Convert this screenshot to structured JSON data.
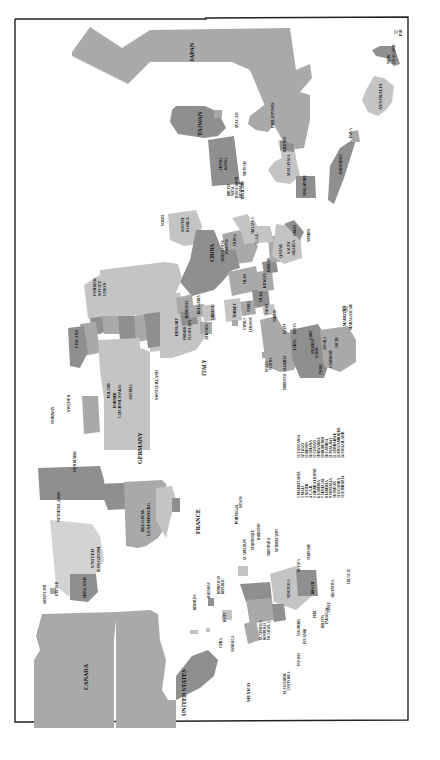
{
  "map": {
    "title": "Cartogram of countries (rotated world map)",
    "orientation": "rotated 90 degrees; labels read bottom-to-top",
    "colors": {
      "background": "#ffffff",
      "border": "#222222",
      "dark": "#8f8f8f",
      "medium": "#a9a9a9",
      "light": "#c4c4c4",
      "lighter": "#d3d3d3",
      "label": "#111111"
    },
    "regions": {
      "asia_pacific": [
        "JAPAN",
        "TAIWAN",
        "MACAO",
        "HONG KONG",
        "PHILIPPINES",
        "BRUNEI",
        "MALAYSIA",
        "SINGAPORE",
        "INDONESIA",
        "PAPUA NEW GUINEA",
        "AUSTRALIA",
        "NEW ZEALAND",
        "FIJI",
        "VIETNAM",
        "THAILAND",
        "MYANMAR",
        "BANGLADESH",
        "NEPAL",
        "BHUTAN",
        "SOUTH KOREA",
        "NORTH KOREA",
        "CHINA",
        "INDIA",
        "SRI LANKA",
        "PAKISTAN",
        "AFGHANISTAN"
      ],
      "middle_east": [
        "IRAN",
        "IRAQ",
        "SYRIA",
        "TURKEY",
        "ISRAEL",
        "JORDAN",
        "LEBANON",
        "CYPRUS",
        "KUWAIT",
        "BAHRAIN",
        "QATAR",
        "U.A.E.",
        "SAUDI ARABIA",
        "OMAN",
        "YEMEN"
      ],
      "europe": [
        "FORMER SOVIET UNION",
        "FINLAND",
        "SWEDEN",
        "NORWAY",
        "POLAND",
        "FORMER CZECHOSLOVAKIA",
        "AUSTRIA",
        "SWITZERLAND",
        "HUNGARY",
        "ROMANIA",
        "BULGARIA",
        "FORMER YUGOSLAVIA",
        "ALBANIA",
        "GREECE",
        "ITALY",
        "GERMANY",
        "DENMARK",
        "NETHERLANDS",
        "BELGIUM-LUXEMBOURG",
        "FRANCE",
        "SPAIN",
        "PORTUGAL",
        "UNITED KINGDOM",
        "IRELAND",
        "ICELAND",
        "GREENLAND",
        "MALTA"
      ],
      "africa": [
        "MOROCCO",
        "ALGERIA",
        "TUNISIA",
        "LIBYA",
        "EGYPT",
        "SUDAN",
        "ETHIOPIA",
        "NIGERIA",
        "CAMEROON",
        "GABON",
        "ZAIRE",
        "ANGOLA",
        "IVORY COAST",
        "KENYA",
        "SOUTH AFRICA",
        "MAURITIUS",
        "MADAGASCAR"
      ],
      "americas": [
        "CANADA",
        "UNITED STATES",
        "MEXICO",
        "CUBA",
        "JAMAICA",
        "HAITI",
        "DOMINICAN REPUBLIC",
        "BAHAMAS",
        "BERMUDA",
        "GUADELOUPE",
        "MARTINIQUE",
        "BARBADOS",
        "TRINIDAD & TOBAGO",
        "NETHERLANDS ANTILLES",
        "GUATEMALA",
        "HONDURAS",
        "NICARAGUA",
        "EL SALVADOR",
        "COSTA RICA",
        "PANAMA",
        "COLOMBIA",
        "VENEZUELA",
        "ECUADOR",
        "PERU",
        "BOLIVIA",
        "BRAZIL",
        "PARAGUAY",
        "CHILE",
        "ARGENTINA",
        "URUGUAY",
        "GUYANA",
        "SURINAME"
      ]
    },
    "labels": {
      "japan": "JAPAN",
      "taiwan": "TAIWAN",
      "macao": "MACAO",
      "hong_kong_1": "HONG",
      "hong_kong_2": "KONG",
      "philippines": "PHILIPPINES",
      "brunei": "BRUNEI",
      "malaysia": "MALAYSIA",
      "singapore": "SINGAPORE",
      "indonesia": "INDONESIA",
      "png_1": "PAPUA",
      "png_2": "NEW",
      "png_3": "GUINEA",
      "australia": "AUSTRALIA",
      "nz_1": "NEW",
      "nz_2": "ZEALAND",
      "fiji": "FIJI",
      "vietnam": "VIETNAM",
      "thailand": "THAILAND",
      "myanmar": "MYANMAR",
      "bangladesh": "BANGLADESH",
      "nepal": "NEPAL",
      "bhutan": "BHUTAN",
      "south_korea_1": "SOUTH",
      "south_korea_2": "KOREA",
      "north_korea_1": "NORTH",
      "north_korea_2": "KOREA",
      "china": "CHINA",
      "afghanistan": "AFGHANISTAN",
      "pakistan": "PAKISTAN",
      "india": "INDIA",
      "sri_lanka": "SRI LANKA",
      "iran": "IRAN",
      "iraq": "IRAQ",
      "syria": "SYRIA",
      "turkey": "TURKEY",
      "israel": "ISRAEL",
      "jordan": "JORDAN",
      "lebanon": "LEBANON",
      "cyprus": "CYPRUS",
      "kuwait": "KUWAIT",
      "bahrain": "BAHRAIN",
      "qatar": "QATAR",
      "uae": "U.A.E.",
      "saudi_1": "SAUDI",
      "saudi_2": "ARABIA",
      "oman": "OMAN",
      "yemen": "YEMEN",
      "fsu_1": "FORMER",
      "fsu_2": "SOVIET",
      "fsu_3": "UNION",
      "finland": "FINLAND",
      "sweden": "SWEDEN",
      "norway": "NORWAY",
      "poland": "POLAND",
      "czech_1": "FORMER",
      "czech_2": "CZECHOSLOVAKIA",
      "austria": "AUSTRIA",
      "switzerland": "SWITZERLAND",
      "hungary": "HUNGARY",
      "romania": "ROMANIA",
      "bulgaria": "BULGARIA",
      "yugo_1": "FORMER",
      "yugo_2": "YUGOSLAVIA",
      "albania": "ALBANIA",
      "greece": "GREECE",
      "italy": "ITALY",
      "germany": "GERMANY",
      "denmark": "DENMARK",
      "netherlands": "NETHERLANDS",
      "belgium_1": "BELGIUM-",
      "belgium_2": "LUXEMBOURG",
      "france": "FRANCE",
      "spain": "SPAIN",
      "portugal": "PORTUGAL",
      "uk_1": "UNITED",
      "uk_2": "KINGDOM",
      "ireland": "IRELAND",
      "iceland": "ICELAND",
      "greenland": "GREENLAND",
      "malta": "MALTA",
      "tunisia": "TUNISIA",
      "morocco": "MOROCCO",
      "algeria": "ALGERIA",
      "libya": "LIBYA",
      "egypt": "EGYPT",
      "sudan_num": "10",
      "ethiopia_num": "12",
      "kenya": "KENYA",
      "nigeria": "NIGERIA",
      "zaire": "ZAIRE",
      "gabon": "GABON",
      "cameroon": "CAMEROON",
      "angola": "ANGOLA",
      "ivory_1": "IVORY",
      "ivory_2": "COAST",
      "south_africa_1": "SOUTH",
      "south_africa_2": "AFRICA",
      "mauritius": "MAURITIUS",
      "madagascar": "MADAGASCAR",
      "canada": "CANADA",
      "usa": "UNITED STATES",
      "mexico": "MEXICO",
      "cuba": "CUBA",
      "jamaica": "JAMAICA",
      "haiti": "HAITI",
      "dominican_1": "DOMINICAN",
      "dominican_2": "REPUBLIC",
      "bahamas": "BAHAMAS",
      "bermuda": "BERMUDA",
      "guadeloupe": "GUADELOUPE",
      "martinique": "MARTINIQUE",
      "barbados": "BARBADOS",
      "trinidad_1": "TRINIDAD &",
      "trinidad_2": "TOBAGO",
      "antilles_1": "NETHERLANDS",
      "antilles_2": "ANTILLES",
      "guatemala": "GUATEMALA",
      "honduras": "HONDURAS",
      "nicaragua": "NICARAGUA",
      "el_salvador": "EL SALVADOR",
      "costa_rica": "COSTA RICA",
      "panama": "PANAMA",
      "colombia": "COLOMBIA",
      "venezuela": "VENEZUELA",
      "ecuador": "ECUADOR",
      "peru": "PERU",
      "bolivia": "BOLIVIA",
      "brazil": "BRAZIL",
      "paraguay": "PARAGUAY",
      "chile": "CHILE",
      "argentina": "ARGENTINA",
      "uruguay": "URUGUAY",
      "guyana": "GUYANA",
      "suriname": "SURINAME"
    },
    "legend": {
      "col1": [
        "1 MAURITANIA",
        "2 MALI",
        "3 NIGER",
        "4 C.A.R.",
        "5 SIERRA LEONE",
        "6 GAMBIA",
        "7 SENEGAL",
        "8 LIBERIA",
        "9 SOMALIA",
        "10 SUDAN",
        "11 UGANDA",
        "12 ETHIOPIA"
      ],
      "col2": [
        "13 TANZANIA",
        "14 TOGO",
        "15 BENIN",
        "16 GHANA",
        "17 CONGO",
        "18 RWANDA",
        "19 BURUNDI",
        "20 ZAMBIA",
        "21 MALAWI",
        "22 ZIMBABWE",
        "23 MOZAMBIQUE",
        "24 SWAZILAND"
      ]
    },
    "africa_numbers": [
      "1",
      "2",
      "3",
      "4",
      "5",
      "6",
      "7",
      "8",
      "9",
      "11",
      "13",
      "14",
      "15",
      "16",
      "17",
      "18",
      "19",
      "20",
      "21",
      "22",
      "23",
      "24"
    ]
  }
}
